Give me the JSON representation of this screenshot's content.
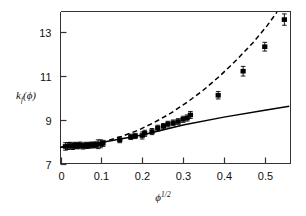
{
  "figure": {
    "background": "#ffffff",
    "frame_color": "#333333",
    "marker_color": "#000000",
    "solid_line_color": "#000000",
    "dashed_line_color": "#000000"
  },
  "chart_data": {
    "type": "scatter",
    "title": "",
    "xlabel": "ϕ",
    "xlabel_exponent": "1/2",
    "ylabel": "k",
    "ylabel_sub": "f",
    "ylabel_arg": "(ϕ)",
    "xlim": [
      0,
      0.563
    ],
    "ylim": [
      7,
      13.95
    ],
    "xticks": [
      0,
      0.1,
      0.2,
      0.3,
      0.4,
      0.5
    ],
    "xticklabels": [
      "0",
      "0.1",
      "0.2",
      "0.3",
      "0.4",
      "0.5"
    ],
    "yticks": [
      7,
      9,
      11,
      13
    ],
    "yticklabels": [
      "7",
      "9",
      "11",
      "13"
    ],
    "grid": false,
    "legend": "none",
    "series": [
      {
        "name": "measured k_f",
        "marker": "filled-square",
        "errorbars": true,
        "points": [
          {
            "x": 0.012,
            "y": 7.78,
            "yerr": 0.17
          },
          {
            "x": 0.018,
            "y": 7.8,
            "yerr": 0.16
          },
          {
            "x": 0.024,
            "y": 7.82,
            "yerr": 0.15
          },
          {
            "x": 0.03,
            "y": 7.79,
            "yerr": 0.15
          },
          {
            "x": 0.036,
            "y": 7.83,
            "yerr": 0.14
          },
          {
            "x": 0.042,
            "y": 7.81,
            "yerr": 0.14
          },
          {
            "x": 0.048,
            "y": 7.84,
            "yerr": 0.14
          },
          {
            "x": 0.055,
            "y": 7.8,
            "yerr": 0.14
          },
          {
            "x": 0.062,
            "y": 7.83,
            "yerr": 0.14
          },
          {
            "x": 0.068,
            "y": 7.82,
            "yerr": 0.13
          },
          {
            "x": 0.074,
            "y": 7.85,
            "yerr": 0.13
          },
          {
            "x": 0.08,
            "y": 7.84,
            "yerr": 0.13
          },
          {
            "x": 0.086,
            "y": 7.86,
            "yerr": 0.13
          },
          {
            "x": 0.092,
            "y": 7.88,
            "yerr": 0.2
          },
          {
            "x": 0.098,
            "y": 7.9,
            "yerr": 0.18
          },
          {
            "x": 0.104,
            "y": 7.92,
            "yerr": 0.14
          },
          {
            "x": 0.145,
            "y": 8.08,
            "yerr": 0.13
          },
          {
            "x": 0.172,
            "y": 8.22,
            "yerr": 0.12
          },
          {
            "x": 0.183,
            "y": 8.26,
            "yerr": 0.12
          },
          {
            "x": 0.2,
            "y": 8.28,
            "yerr": 0.16
          },
          {
            "x": 0.206,
            "y": 8.38,
            "yerr": 0.14
          },
          {
            "x": 0.224,
            "y": 8.46,
            "yerr": 0.14
          },
          {
            "x": 0.238,
            "y": 8.62,
            "yerr": 0.13
          },
          {
            "x": 0.252,
            "y": 8.7,
            "yerr": 0.13
          },
          {
            "x": 0.263,
            "y": 8.8,
            "yerr": 0.13
          },
          {
            "x": 0.276,
            "y": 8.86,
            "yerr": 0.13
          },
          {
            "x": 0.288,
            "y": 8.92,
            "yerr": 0.13
          },
          {
            "x": 0.3,
            "y": 9.02,
            "yerr": 0.14
          },
          {
            "x": 0.31,
            "y": 9.08,
            "yerr": 0.14
          },
          {
            "x": 0.318,
            "y": 9.22,
            "yerr": 0.16
          },
          {
            "x": 0.386,
            "y": 10.12,
            "yerr": 0.17
          },
          {
            "x": 0.447,
            "y": 11.22,
            "yerr": 0.22
          },
          {
            "x": 0.5,
            "y": 12.34,
            "yerr": 0.2
          },
          {
            "x": 0.548,
            "y": 13.58,
            "yerr": 0.26
          }
        ]
      },
      {
        "name": "dashed-model-curve",
        "style": "dashed",
        "points": [
          {
            "x": 0.0,
            "y": 7.74
          },
          {
            "x": 0.04,
            "y": 7.8
          },
          {
            "x": 0.08,
            "y": 7.9
          },
          {
            "x": 0.11,
            "y": 8.02
          },
          {
            "x": 0.15,
            "y": 8.24
          },
          {
            "x": 0.19,
            "y": 8.52
          },
          {
            "x": 0.23,
            "y": 8.88
          },
          {
            "x": 0.27,
            "y": 9.3
          },
          {
            "x": 0.31,
            "y": 9.8
          },
          {
            "x": 0.35,
            "y": 10.36
          },
          {
            "x": 0.39,
            "y": 11.0
          },
          {
            "x": 0.43,
            "y": 11.72
          },
          {
            "x": 0.47,
            "y": 12.5
          },
          {
            "x": 0.505,
            "y": 13.28
          },
          {
            "x": 0.53,
            "y": 13.92
          }
        ]
      },
      {
        "name": "solid-model-curve",
        "style": "solid",
        "points": [
          {
            "x": 0.0,
            "y": 7.74
          },
          {
            "x": 0.1,
            "y": 7.96
          },
          {
            "x": 0.2,
            "y": 8.3
          },
          {
            "x": 0.3,
            "y": 8.76
          },
          {
            "x": 0.4,
            "y": 9.12
          },
          {
            "x": 0.5,
            "y": 9.44
          },
          {
            "x": 0.56,
            "y": 9.62
          }
        ]
      }
    ]
  }
}
